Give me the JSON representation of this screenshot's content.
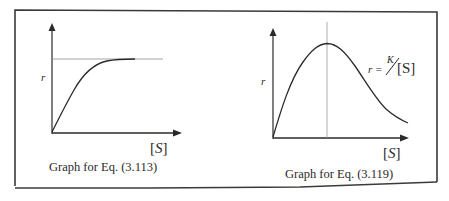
{
  "figure": {
    "left_graph": {
      "caption": "Graph for Eq. (3.113)",
      "y_axis_label": "r",
      "x_axis_label_open": "[",
      "x_axis_label_var": "S",
      "x_axis_label_close": "]",
      "description": "Saturating curve: r rises from origin and levels off at a horizontal asymptote (dotted line)"
    },
    "right_graph": {
      "caption": "Graph for Eq. (3.119)",
      "y_axis_label": "r",
      "x_axis_label_open": "[",
      "x_axis_label_var": "S",
      "x_axis_label_close": "]",
      "equation_lhs": "r = ",
      "equation_num": "K",
      "equation_den": "[S]",
      "description": "Curve rises from origin to a maximum (vertical dotted line at peak) then decays as r = K/[S]"
    },
    "colors": {
      "ink": "#2a2a2a",
      "border": "#3a3a3a",
      "guide": "#9a9a9a",
      "background": "#ffffff"
    }
  }
}
